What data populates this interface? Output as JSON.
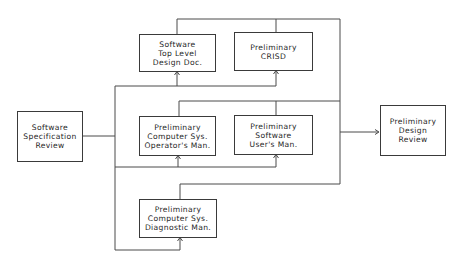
{
  "diagram": {
    "boxes": {
      "ssr": {
        "label": "Software\nSpecification\nReview"
      },
      "tld": {
        "label": "Software\nTop Level\nDesign Doc."
      },
      "crisd": {
        "label": "Preliminary\nCRISD"
      },
      "csom": {
        "label": "Preliminary\nComputer Sys.\nOperator's Man."
      },
      "sum": {
        "label": "Preliminary\nSoftware\nUser's Man."
      },
      "csdm": {
        "label": "Preliminary\nComputer Sys.\nDiagnostic Man."
      },
      "pdr": {
        "label": "Preliminary\nDesign\nReview"
      }
    },
    "colors": {
      "line": "#4a4a4a",
      "border": "#3a3a3a",
      "text": "#1f1f1f",
      "background": "#ffffff"
    }
  }
}
